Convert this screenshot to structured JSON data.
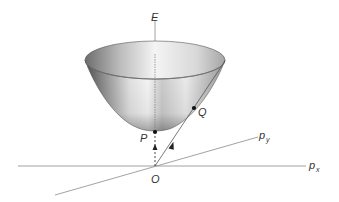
{
  "diagram": {
    "type": "3D paraboloid energy surface over momentum plane",
    "axes": {
      "vertical": {
        "label": "E"
      },
      "horizontal_x": {
        "label": "p",
        "subscript": "x"
      },
      "horizontal_y": {
        "label": "p",
        "subscript": "y"
      }
    },
    "points": {
      "origin": {
        "label": "O"
      },
      "vertex": {
        "label": "P"
      },
      "surface_point": {
        "label": "Q"
      }
    },
    "colors": {
      "axis_line": "#8a8a8a",
      "text": "#333333",
      "surface_dark": "#5a5a5a",
      "surface_light": "#f2f2f2",
      "point": "#111111"
    }
  }
}
